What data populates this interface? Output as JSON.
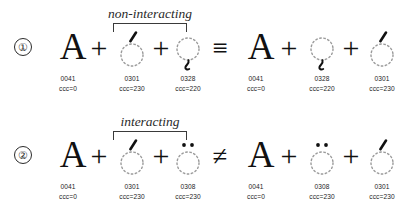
{
  "figure": {
    "ink_color": "#111111",
    "caption_color": "#1d1d1d",
    "bracket_color": "#3a3a3a"
  },
  "symbols": {
    "plus": "+",
    "identical": "≡",
    "not_equal": "≠",
    "base_letter": "A",
    "dotted_circle": "◌"
  },
  "rows": [
    {
      "number": "①",
      "bracket_label": "non-interacting",
      "relation": "≡",
      "left": {
        "terms": [
          {
            "glyph": "A",
            "kind": "base",
            "mark": "none",
            "codepoint": "0041",
            "ccc": "ccc=0"
          },
          {
            "glyph": "◌́",
            "kind": "combining",
            "mark": "acute",
            "codepoint": "0301",
            "ccc": "ccc=230"
          },
          {
            "glyph": "◌̨",
            "kind": "combining",
            "mark": "ogonek",
            "codepoint": "0328",
            "ccc": "ccc=220"
          }
        ]
      },
      "right": {
        "terms": [
          {
            "glyph": "A",
            "kind": "base",
            "mark": "none",
            "codepoint": "0041",
            "ccc": "ccc=0"
          },
          {
            "glyph": "◌̨",
            "kind": "combining",
            "mark": "ogonek",
            "codepoint": "0328",
            "ccc": "ccc=220"
          },
          {
            "glyph": "◌́",
            "kind": "combining",
            "mark": "acute",
            "codepoint": "0301",
            "ccc": "ccc=230"
          }
        ]
      }
    },
    {
      "number": "②",
      "bracket_label": "interacting",
      "relation": "≠",
      "left": {
        "terms": [
          {
            "glyph": "A",
            "kind": "base",
            "mark": "none",
            "codepoint": "0041",
            "ccc": "ccc=0"
          },
          {
            "glyph": "◌́",
            "kind": "combining",
            "mark": "acute",
            "codepoint": "0301",
            "ccc": "ccc=230"
          },
          {
            "glyph": "◌̈",
            "kind": "combining",
            "mark": "diaeresis",
            "codepoint": "0308",
            "ccc": "ccc=230"
          }
        ]
      },
      "right": {
        "terms": [
          {
            "glyph": "A",
            "kind": "base",
            "mark": "none",
            "codepoint": "0041",
            "ccc": "ccc=0"
          },
          {
            "glyph": "◌̈",
            "kind": "combining",
            "mark": "diaeresis",
            "codepoint": "0308",
            "ccc": "ccc=230"
          },
          {
            "glyph": "◌́",
            "kind": "combining",
            "mark": "acute",
            "codepoint": "0301",
            "ccc": "ccc=230"
          }
        ]
      }
    }
  ]
}
